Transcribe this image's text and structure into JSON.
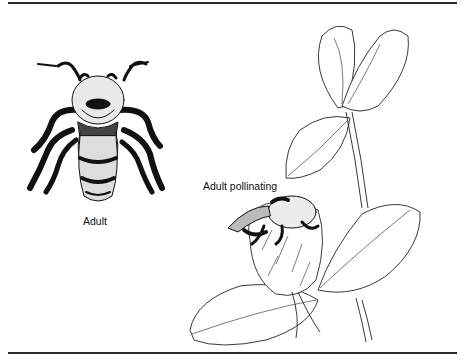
{
  "figure": {
    "labels": {
      "adult": "Adult",
      "adult_pollinating": "Adult pollinating"
    },
    "panels": [
      {
        "name": "adult-bee-illustration",
        "caption": "Adult"
      },
      {
        "name": "bee-pollinating-clover-illustration",
        "caption": "Adult pollinating"
      }
    ],
    "colors": {
      "ink": "#111111",
      "rule": "#2b2b2b",
      "background": "#ffffff"
    }
  }
}
